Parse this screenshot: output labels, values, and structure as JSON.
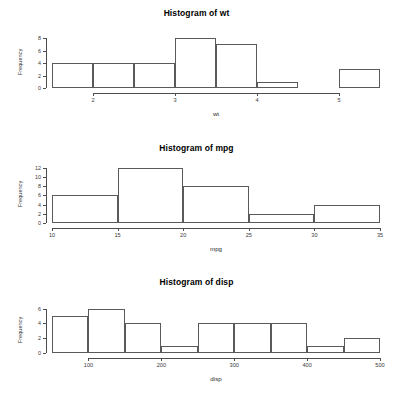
{
  "chart_data": [
    {
      "type": "bar",
      "title": "Histogram of wt",
      "xlabel": "wt",
      "ylabel": "Frequency",
      "bin_width": 0.5,
      "bin_edges": [
        1.5,
        2.0,
        2.5,
        3.0,
        3.5,
        4.0,
        4.5,
        5.0,
        5.5
      ],
      "categories": [
        "1.5-2.0",
        "2.0-2.5",
        "2.5-3.0",
        "3.0-3.5",
        "3.5-4.0",
        "4.0-4.5",
        "4.5-5.0",
        "5.0-5.5"
      ],
      "values": [
        4,
        4,
        4,
        8,
        7,
        1,
        0,
        3
      ],
      "xticks": [
        2,
        3,
        4,
        5
      ],
      "xtick_labels": [
        "2",
        "3",
        "4",
        "5"
      ],
      "yticks": [
        0,
        2,
        4,
        6,
        8
      ],
      "ytick_labels": [
        "0",
        "2",
        "4",
        "6",
        "8"
      ],
      "xlim": [
        1.5,
        5.5
      ],
      "ylim": [
        0,
        8
      ],
      "grid": false,
      "legend": false
    },
    {
      "type": "bar",
      "title": "Histogram of mpg",
      "xlabel": "mpg",
      "ylabel": "Frequency",
      "bin_width": 5,
      "bin_edges": [
        10,
        15,
        20,
        25,
        30,
        35
      ],
      "categories": [
        "10-15",
        "15-20",
        "20-25",
        "25-30",
        "30-35"
      ],
      "values": [
        6,
        12,
        8,
        2,
        4
      ],
      "xticks": [
        10,
        15,
        20,
        25,
        30,
        35
      ],
      "xtick_labels": [
        "10",
        "15",
        "20",
        "25",
        "30",
        "35"
      ],
      "yticks": [
        0,
        2,
        4,
        6,
        8,
        10,
        12
      ],
      "ytick_labels": [
        "0",
        "2",
        "4",
        "6",
        "8",
        "10",
        "12"
      ],
      "xlim": [
        10,
        35
      ],
      "ylim": [
        0,
        12
      ],
      "grid": false,
      "legend": false
    },
    {
      "type": "bar",
      "title": "Histogram of disp",
      "xlabel": "disp",
      "ylabel": "Frequency",
      "bin_width": 50,
      "bin_edges": [
        50,
        100,
        150,
        200,
        250,
        300,
        350,
        400,
        450,
        500
      ],
      "categories": [
        "50-100",
        "100-150",
        "150-200",
        "200-250",
        "250-300",
        "300-350",
        "350-400",
        "400-450",
        "450-500"
      ],
      "values": [
        5,
        6,
        4,
        1,
        4,
        4,
        4,
        1,
        2
      ],
      "xticks": [
        100,
        200,
        300,
        400,
        500
      ],
      "xtick_labels": [
        "100",
        "200",
        "300",
        "400",
        "500"
      ],
      "yticks": [
        0,
        2,
        4,
        6
      ],
      "ytick_labels": [
        "0",
        "2",
        "4",
        "6"
      ],
      "xlim": [
        50,
        500
      ],
      "ylim": [
        0,
        6.5
      ],
      "grid": false,
      "legend": false
    }
  ],
  "panels": [
    {
      "title": "Histogram of wt",
      "xlabel": "wt",
      "ylabel": "Frequency"
    },
    {
      "title": "Histogram of mpg",
      "xlabel": "mpg",
      "ylabel": "Frequency"
    },
    {
      "title": "Histogram of disp",
      "xlabel": "disp",
      "ylabel": "Frequency"
    }
  ],
  "colors": {
    "background": "#ffffff",
    "axis": "#4d4d4d",
    "bar_outline": "#5a5a5a",
    "text": "#2b2b2b"
  }
}
